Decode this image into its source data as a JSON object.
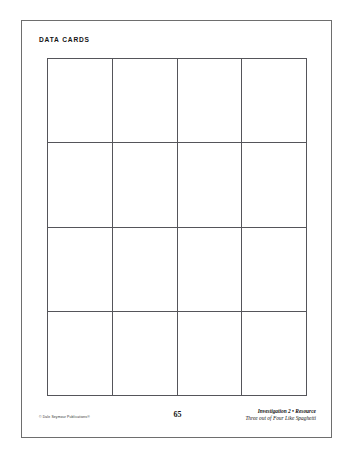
{
  "page": {
    "title": "DATA CARDS",
    "page_number": "65"
  },
  "footer": {
    "copyright": "© Dale Seymour Publications®",
    "investigation": "Investigation 2 • Resource",
    "unit_title": "Three out of Four Like Spaghetti"
  },
  "grid": {
    "columns": 4,
    "rows": 4,
    "cells": [
      {
        "text": ""
      },
      {
        "text": ""
      },
      {
        "text": ""
      },
      {
        "text": ""
      },
      {
        "text": ""
      },
      {
        "text": ""
      },
      {
        "text": ""
      },
      {
        "text": ""
      },
      {
        "text": ""
      },
      {
        "text": ""
      },
      {
        "text": ""
      },
      {
        "text": ""
      },
      {
        "text": ""
      },
      {
        "text": ""
      },
      {
        "text": ""
      },
      {
        "text": ""
      }
    ]
  },
  "colors": {
    "page_border": "#6e6e6e",
    "grid_line": "#55555a",
    "text": "#141414",
    "background": "#ffffff"
  }
}
